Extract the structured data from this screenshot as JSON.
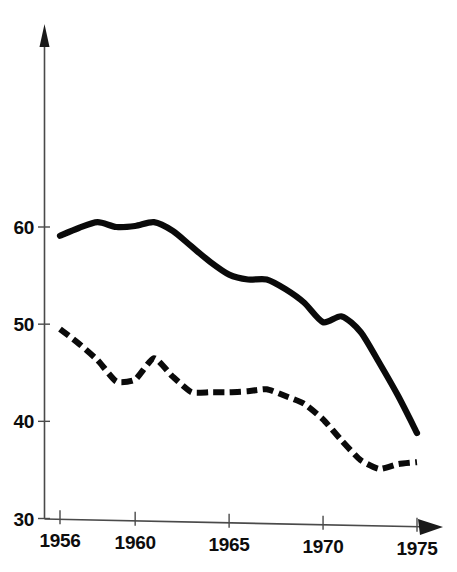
{
  "chart_data": {
    "type": "line",
    "title": "",
    "subtitle": "",
    "xlabel": "",
    "ylabel": "",
    "xlim": [
      1955.5,
      1975.7
    ],
    "ylim": [
      30,
      66
    ],
    "grid": false,
    "legend": "none",
    "x_tick_labels": [
      "1956",
      "1960",
      "1965",
      "1970",
      "1975"
    ],
    "x_tick_values": [
      1956,
      1960,
      1965,
      1970,
      1975
    ],
    "y_tick_labels": [
      "30",
      "40",
      "50",
      "60"
    ],
    "y_tick_values": [
      30,
      40,
      50,
      60
    ],
    "x": [
      1956,
      1957,
      1958,
      1959,
      1960,
      1961,
      1962,
      1963,
      1964,
      1965,
      1966,
      1967,
      1968,
      1969,
      1970,
      1971,
      1972,
      1973,
      1974,
      1975
    ],
    "series": [
      {
        "name": "solid-series",
        "style": "solid",
        "color": "#0a0a0a",
        "values": [
          59.1,
          59.9,
          60.5,
          60.0,
          60.1,
          60.5,
          59.6,
          58.0,
          56.4,
          55.1,
          54.6,
          54.6,
          53.6,
          52.2,
          50.2,
          50.8,
          49.2,
          46.0,
          42.6,
          38.8
        ]
      },
      {
        "name": "dashed-series",
        "style": "dashed",
        "color": "#0a0a0a",
        "values": [
          49.5,
          48.0,
          46.3,
          44.1,
          44.3,
          46.5,
          44.6,
          43.0,
          43.0,
          43.0,
          43.1,
          43.3,
          42.6,
          41.8,
          40.2,
          38.0,
          36.0,
          35.1,
          35.6,
          35.8
        ]
      }
    ]
  },
  "axes": {
    "y_axis_name": "value-axis",
    "x_axis_name": "year-axis",
    "y_arrow": "up-arrow",
    "x_arrow": "right-arrow"
  }
}
